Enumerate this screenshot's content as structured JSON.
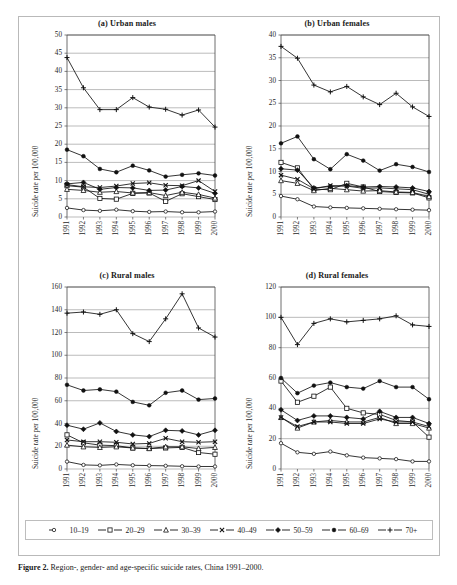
{
  "figure": {
    "caption_label": "Figure 2.",
    "caption_text": "Region-, gender- and age-specific suicide rates, China 1991–2000."
  },
  "legend": {
    "position": "bottom",
    "items": [
      {
        "label": "10–19",
        "marker": "open-circle-small",
        "key": "a10_19"
      },
      {
        "label": "20–29",
        "marker": "open-square",
        "key": "a20_29"
      },
      {
        "label": "30–39",
        "marker": "open-triangle",
        "key": "a30_39"
      },
      {
        "label": "40–49",
        "marker": "cross-x",
        "key": "a40_49"
      },
      {
        "label": "50–59",
        "marker": "filled-diamond",
        "key": "a50_59"
      },
      {
        "label": "60–69",
        "marker": "filled-circle",
        "key": "a60_69"
      },
      {
        "label": "70+",
        "marker": "plus",
        "key": "a70"
      }
    ]
  },
  "chart_data": [
    {
      "type": "line",
      "panel": "a",
      "title": "(a) Urban males",
      "xlabel": "",
      "ylabel": "Suicide rate per 100,000",
      "x": [
        "1991",
        "1992",
        "1993",
        "1994",
        "1995",
        "1996",
        "1997",
        "1998",
        "1999",
        "2000"
      ],
      "ylim": [
        0,
        50
      ],
      "yticks": [
        0,
        5,
        10,
        15,
        20,
        25,
        30,
        35,
        40,
        45,
        50
      ],
      "grid": true,
      "series": [
        {
          "name": "10–19",
          "marker": "open-circle-small",
          "values": [
            2.5,
            1.9,
            1.7,
            2.0,
            1.6,
            1.4,
            1.5,
            1.3,
            1.3,
            1.5
          ]
        },
        {
          "name": "20–29",
          "marker": "open-square",
          "values": [
            8.6,
            8.2,
            5.1,
            4.9,
            6.5,
            6.6,
            4.3,
            6.4,
            5.6,
            4.8
          ]
        },
        {
          "name": "30–39",
          "marker": "open-triangle",
          "values": [
            7.6,
            7.3,
            6.8,
            7.0,
            6.6,
            6.7,
            5.9,
            6.8,
            6.2,
            5.2
          ]
        },
        {
          "name": "40–49",
          "marker": "cross-x",
          "values": [
            8.9,
            8.3,
            8.1,
            8.5,
            9.2,
            9.4,
            8.7,
            8.6,
            10.0,
            7.0
          ]
        },
        {
          "name": "50–59",
          "marker": "filled-diamond",
          "values": [
            9.1,
            9.5,
            7.6,
            8.1,
            8.0,
            7.3,
            7.4,
            8.4,
            8.0,
            6.5
          ]
        },
        {
          "name": "60–69",
          "marker": "filled-circle",
          "values": [
            18.5,
            16.7,
            13.2,
            12.3,
            14.1,
            12.8,
            11.1,
            11.6,
            12.0,
            11.4
          ]
        },
        {
          "name": "70+",
          "marker": "plus",
          "values": [
            43.8,
            35.5,
            29.5,
            29.5,
            32.8,
            30.2,
            29.6,
            28.0,
            29.4,
            24.7
          ]
        }
      ]
    },
    {
      "type": "line",
      "panel": "b",
      "title": "(b) Urban females",
      "xlabel": "",
      "ylabel": "Suicide rate per 100,000",
      "x": [
        "1991",
        "1992",
        "1993",
        "1994",
        "1995",
        "1996",
        "1997",
        "1998",
        "1999",
        "2000"
      ],
      "ylim": [
        0,
        40
      ],
      "yticks": [
        0,
        5,
        10,
        15,
        20,
        25,
        30,
        35,
        40
      ],
      "grid": true,
      "series": [
        {
          "name": "10–19",
          "marker": "open-circle-small",
          "values": [
            4.6,
            3.9,
            2.3,
            2.1,
            2.0,
            1.9,
            1.8,
            1.7,
            1.6,
            1.5
          ]
        },
        {
          "name": "20–29",
          "marker": "open-square",
          "values": [
            12.0,
            10.8,
            6.1,
            6.0,
            7.4,
            6.6,
            5.6,
            5.4,
            5.3,
            4.2
          ]
        },
        {
          "name": "30–39",
          "marker": "open-triangle",
          "values": [
            8.0,
            7.4,
            5.8,
            6.3,
            6.0,
            5.7,
            5.8,
            5.5,
            5.4,
            4.5
          ]
        },
        {
          "name": "40–49",
          "marker": "cross-x",
          "values": [
            9.2,
            8.3,
            6.2,
            6.9,
            6.8,
            6.3,
            6.4,
            6.2,
            6.0,
            5.0
          ]
        },
        {
          "name": "50–59",
          "marker": "filled-diamond",
          "values": [
            10.6,
            10.3,
            6.4,
            6.7,
            6.9,
            6.6,
            6.7,
            6.6,
            6.4,
            5.6
          ]
        },
        {
          "name": "60–69",
          "marker": "filled-circle",
          "values": [
            16.2,
            17.7,
            12.7,
            10.5,
            13.8,
            12.4,
            10.2,
            11.6,
            11.0,
            9.9
          ]
        },
        {
          "name": "70+",
          "marker": "plus",
          "values": [
            37.5,
            34.9,
            29.0,
            27.5,
            28.7,
            26.4,
            24.7,
            27.2,
            24.2,
            22.1
          ]
        }
      ]
    },
    {
      "type": "line",
      "panel": "c",
      "title": "(c) Rural males",
      "xlabel": "",
      "ylabel": "Suicide rate per 100,000",
      "x": [
        "1991",
        "1992",
        "1993",
        "1994",
        "1995",
        "1996",
        "1997",
        "1998",
        "1999",
        "2000"
      ],
      "ylim": [
        0,
        160
      ],
      "yticks": [
        0,
        20,
        40,
        60,
        80,
        100,
        120,
        140,
        160
      ],
      "grid": true,
      "series": [
        {
          "name": "10–19",
          "marker": "open-circle-small",
          "values": [
            6.5,
            3.6,
            3.2,
            4.0,
            3.3,
            3.0,
            2.8,
            2.4,
            2.2,
            2.2
          ]
        },
        {
          "name": "20–29",
          "marker": "open-square",
          "values": [
            30.0,
            23.0,
            21.0,
            20.5,
            18.5,
            18.0,
            18.5,
            19.0,
            14.5,
            13.0
          ]
        },
        {
          "name": "30–39",
          "marker": "open-triangle",
          "values": [
            21.0,
            19.5,
            19.0,
            19.5,
            18.5,
            18.0,
            19.5,
            19.5,
            18.0,
            19.0
          ]
        },
        {
          "name": "40–49",
          "marker": "cross-x",
          "values": [
            25.5,
            24.0,
            24.0,
            23.5,
            22.0,
            22.5,
            27.0,
            24.0,
            23.5,
            24.0
          ]
        },
        {
          "name": "50–59",
          "marker": "filled-diamond",
          "values": [
            38.5,
            35.0,
            40.5,
            33.0,
            30.0,
            28.5,
            34.0,
            33.5,
            30.0,
            34.0
          ]
        },
        {
          "name": "60–69",
          "marker": "filled-circle",
          "values": [
            74.0,
            69.0,
            70.0,
            68.0,
            59.0,
            56.0,
            67.0,
            69.0,
            61.0,
            62.0
          ]
        },
        {
          "name": "70+",
          "marker": "plus",
          "values": [
            137.0,
            138.0,
            136.0,
            140.0,
            119.0,
            112.0,
            132.0,
            154.0,
            124.0,
            116.0
          ]
        }
      ]
    },
    {
      "type": "line",
      "panel": "d",
      "title": "(d) Rural females",
      "xlabel": "",
      "ylabel": "Suicide rate per 100,000",
      "x": [
        "1991",
        "1992",
        "1993",
        "1994",
        "1995",
        "1996",
        "1997",
        "1998",
        "1999",
        "2000"
      ],
      "ylim": [
        0,
        120
      ],
      "yticks": [
        0,
        20,
        40,
        60,
        80,
        100,
        120
      ],
      "grid": true,
      "series": [
        {
          "name": "10–19",
          "marker": "open-circle-small",
          "values": [
            17.0,
            11.0,
            10.0,
            11.5,
            9.0,
            7.5,
            7.0,
            6.5,
            5.0,
            5.0
          ]
        },
        {
          "name": "20–29",
          "marker": "open-square",
          "values": [
            58.0,
            44.0,
            48.0,
            54.0,
            40.0,
            37.0,
            36.0,
            32.0,
            31.0,
            21.0
          ]
        },
        {
          "name": "30–39",
          "marker": "open-triangle",
          "values": [
            34.0,
            27.0,
            31.0,
            32.0,
            31.0,
            31.0,
            34.0,
            30.0,
            30.0,
            27.0
          ]
        },
        {
          "name": "40–49",
          "marker": "cross-x",
          "values": [
            34.0,
            28.0,
            31.0,
            31.0,
            30.0,
            30.0,
            33.0,
            31.0,
            31.0,
            28.0
          ]
        },
        {
          "name": "50–59",
          "marker": "filled-diamond",
          "values": [
            39.0,
            32.0,
            35.0,
            35.0,
            34.0,
            33.0,
            38.0,
            34.0,
            34.0,
            30.0
          ]
        },
        {
          "name": "60–69",
          "marker": "filled-circle",
          "values": [
            60.0,
            50.0,
            55.0,
            57.0,
            54.0,
            53.0,
            58.0,
            54.0,
            54.0,
            46.0
          ]
        },
        {
          "name": "70+",
          "marker": "plus",
          "values": [
            100.0,
            82.0,
            96.0,
            99.0,
            97.0,
            98.0,
            99.0,
            101.0,
            95.0,
            94.0
          ]
        }
      ]
    }
  ]
}
